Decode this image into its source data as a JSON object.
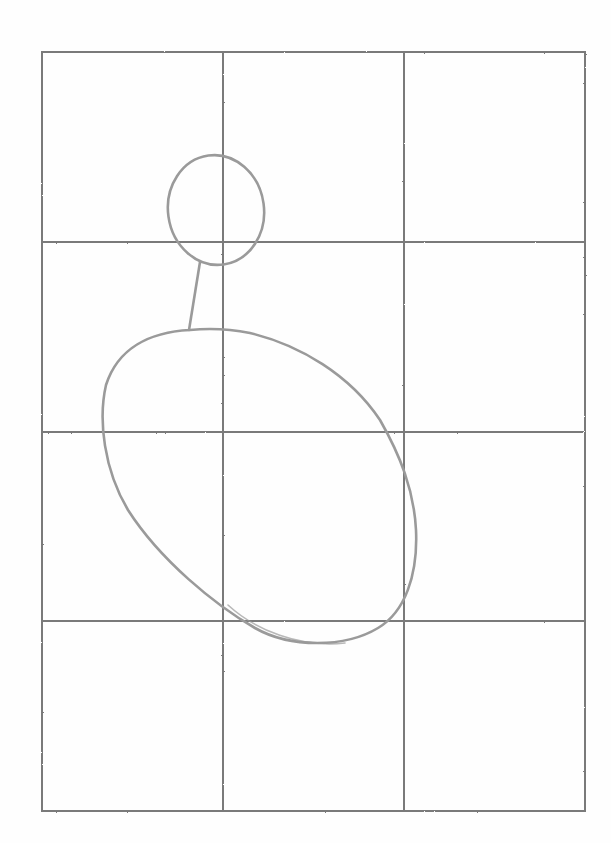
{
  "image": {
    "kind": "pencil sketch on white paper",
    "description": "Construction drawing of a figure: a 3x4 reference grid with a small head circle, a neck line, and a large tilted body oval",
    "colors": {
      "paper": "#fefefe",
      "grid_line": "#7a7a7a",
      "shape_line": "#9a9a9a"
    }
  },
  "grid": {
    "columns": 3,
    "rows": 4,
    "x_lines": [
      42,
      223,
      404,
      585
    ],
    "y_lines": [
      52,
      242,
      432,
      621,
      811
    ]
  },
  "shapes": {
    "head": {
      "type": "circle",
      "cx": 216,
      "cy": 210,
      "rx": 48,
      "ry": 55
    },
    "neck": {
      "type": "line",
      "x1": 200,
      "y1": 262,
      "x2": 189,
      "y2": 330
    },
    "body": {
      "type": "oval",
      "label": "tilted body oval"
    }
  }
}
